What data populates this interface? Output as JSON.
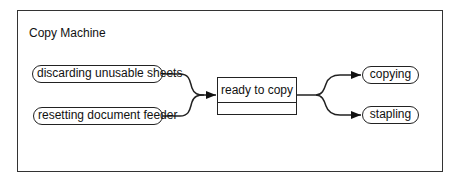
{
  "diagram": {
    "title": "Copy Machine",
    "type": "state transition diagram",
    "incoming_states": [
      {
        "label": "discarding unusable sheets"
      },
      {
        "label": "resetting document feeder"
      }
    ],
    "central_state": {
      "label": "ready to copy",
      "compartment": ""
    },
    "outgoing_states": [
      {
        "label": "copying"
      },
      {
        "label": "stapling"
      }
    ],
    "transitions": [
      {
        "from": "discarding unusable sheets",
        "to": "ready to copy"
      },
      {
        "from": "resetting document feeder",
        "to": "ready to copy"
      },
      {
        "from": "ready to copy",
        "to": "copying"
      },
      {
        "from": "ready to copy",
        "to": "stapling"
      }
    ],
    "colors": {
      "line": "#222222",
      "background": "#ffffff"
    }
  }
}
